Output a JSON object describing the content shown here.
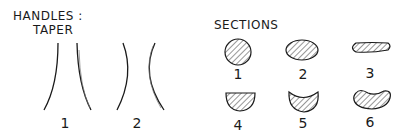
{
  "handles": {
    "title_line1": "HANDLES :",
    "title_line2": "TAPER",
    "items": [
      {
        "label": "1",
        "description": "straight taper"
      },
      {
        "label": "2",
        "description": "curved taper"
      }
    ]
  },
  "sections": {
    "title": "SECTIONS",
    "items": [
      {
        "label": "1",
        "shape": "circle"
      },
      {
        "label": "2",
        "shape": "oval"
      },
      {
        "label": "3",
        "shape": "flat-oval"
      },
      {
        "label": "4",
        "shape": "half-round"
      },
      {
        "label": "5",
        "shape": "crescent"
      },
      {
        "label": "6",
        "shape": "kidney"
      }
    ]
  },
  "colors": {
    "ink": "#1a1a1a",
    "background": "#ffffff"
  }
}
